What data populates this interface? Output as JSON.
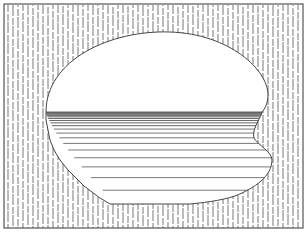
{
  "figure": {
    "kind": "line-drawing",
    "frame": {
      "x": 4,
      "y": 4,
      "width": 299,
      "height": 224,
      "stroke": "#555555"
    },
    "background_hatch": {
      "style": "vertical-dashed",
      "spacing": 5,
      "color": "#777777"
    },
    "shape": {
      "fill": "#ffffff",
      "outline": "#444444",
      "upper_region": "dome (blank)",
      "divider_y": 112,
      "lower_region": "horizontal line shading",
      "shading_line_color": "#555555"
    },
    "colors": {
      "background": "#ffffff",
      "ink": "#555555"
    }
  }
}
